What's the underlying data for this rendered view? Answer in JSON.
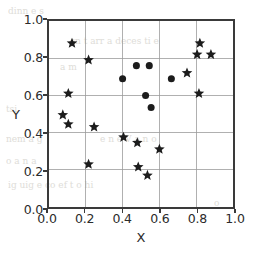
{
  "chart_data": {
    "type": "scatter",
    "title": "",
    "xlabel": "X",
    "ylabel": "Y",
    "xlim": [
      0.0,
      1.0
    ],
    "ylim": [
      0.0,
      1.0
    ],
    "grid": true,
    "legend": "none",
    "xticks": [
      "0.0",
      "0.2",
      "0.4",
      "0.6",
      "0.8",
      "1.0"
    ],
    "xtick_values": [
      0.0,
      0.2,
      0.4,
      0.6,
      0.8,
      1.0
    ],
    "yticks": [
      "0.0",
      "0.2",
      "0.4",
      "0.6",
      "0.8",
      "1.0"
    ],
    "ytick_values": [
      0.0,
      0.2,
      0.4,
      0.6,
      0.8,
      1.0
    ],
    "series": [
      {
        "name": "circles",
        "marker": "circle",
        "color": "#1c1c1c",
        "size": 7.2,
        "points": [
          [
            0.4,
            0.69
          ],
          [
            0.475,
            0.76
          ],
          [
            0.545,
            0.76
          ],
          [
            0.525,
            0.6
          ],
          [
            0.555,
            0.535
          ],
          [
            0.665,
            0.69
          ]
        ]
      },
      {
        "name": "stars",
        "marker": "star",
        "color": "#1c1c1c",
        "size": 9.0,
        "points": [
          [
            0.125,
            0.88
          ],
          [
            0.215,
            0.79
          ],
          [
            0.105,
            0.61
          ],
          [
            0.075,
            0.495
          ],
          [
            0.105,
            0.445
          ],
          [
            0.245,
            0.43
          ],
          [
            0.405,
            0.375
          ],
          [
            0.48,
            0.345
          ],
          [
            0.6,
            0.31
          ],
          [
            0.215,
            0.23
          ],
          [
            0.485,
            0.215
          ],
          [
            0.535,
            0.17
          ],
          [
            0.82,
            0.88
          ],
          [
            0.805,
            0.82
          ],
          [
            0.88,
            0.82
          ],
          [
            0.75,
            0.72
          ],
          [
            0.815,
            0.61
          ]
        ]
      }
    ]
  },
  "ghost_text": [
    {
      "text": "dinn   e   s",
      "x": 8,
      "y": 6
    },
    {
      "text": "cn  t   arr  a deces  ti   e",
      "x": 70,
      "y": 36
    },
    {
      "text": "a   m",
      "x": 60,
      "y": 62
    },
    {
      "text": "tsi",
      "x": 6,
      "y": 104
    },
    {
      "text": "nem     a  g",
      "x": 6,
      "y": 134
    },
    {
      "text": "e  n      e   V a  n   o",
      "x": 100,
      "y": 134
    },
    {
      "text": "o  a  n       a",
      "x": 6,
      "y": 156
    },
    {
      "text": "ig  uig       e  co ef t  o   hi",
      "x": 8,
      "y": 180
    },
    {
      "text": "o",
      "x": 214,
      "y": 198
    }
  ]
}
